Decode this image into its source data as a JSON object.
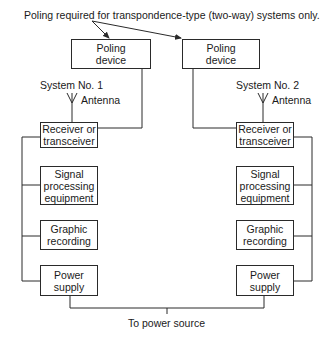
{
  "caption": "Poling required for transpondence-type (two-way) systems only.",
  "systems": [
    {
      "name": "System No. 1",
      "antenna_label": "Antenna",
      "poling_device": "Poling device",
      "receiver": "Receiver or transceiver",
      "signal_processing": "Signal processing equipment",
      "graphic_recording": "Graphic recording",
      "power_supply": "Power supply"
    },
    {
      "name": "System No. 2",
      "antenna_label": "Antenna",
      "poling_device": "Poling device",
      "receiver": "Receiver or transceiver",
      "signal_processing": "Signal processing equipment",
      "graphic_recording": "Graphic recording",
      "power_supply": "Power supply"
    }
  ],
  "power_source_label": "To power source",
  "colors": {
    "line": "#2a2a2a",
    "background": "#ffffff"
  }
}
